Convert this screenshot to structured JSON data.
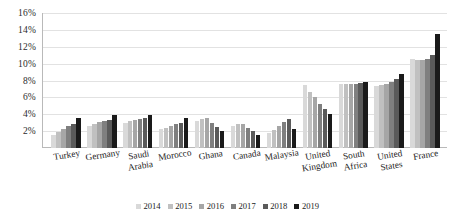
{
  "chart_data": {
    "type": "bar",
    "title": "",
    "xlabel": "",
    "ylabel": "",
    "ylim": [
      0,
      16
    ],
    "y_ticks": [
      "2%",
      "4%",
      "6%",
      "8%",
      "10%",
      "12%",
      "14%",
      "16%"
    ],
    "y_tick_values": [
      2,
      4,
      6,
      8,
      10,
      12,
      14,
      16
    ],
    "grid": true,
    "legend_position": "bottom",
    "categories": [
      "Turkey",
      "Germany",
      "Saudi\nArabia",
      "Morocco",
      "Ghana",
      "Canada",
      "Malaysia",
      "United\nKingdom",
      "South\nAfrica",
      "United\nStates",
      "France"
    ],
    "series": [
      {
        "name": "2014",
        "color": "#d9d9d9",
        "values": [
          1.5,
          2.6,
          3.0,
          2.2,
          3.2,
          2.6,
          1.8,
          7.5,
          7.6,
          7.4,
          10.5
        ]
      },
      {
        "name": "2015",
        "color": "#c0c0c0",
        "values": [
          1.9,
          2.9,
          3.2,
          2.4,
          3.4,
          2.8,
          2.1,
          6.6,
          7.6,
          7.5,
          10.4
        ]
      },
      {
        "name": "2016",
        "color": "#a6a6a6",
        "values": [
          2.2,
          3.1,
          3.3,
          2.6,
          3.5,
          2.9,
          2.6,
          6.0,
          7.6,
          7.6,
          10.4
        ]
      },
      {
        "name": "2017",
        "color": "#7f7f7f",
        "values": [
          2.6,
          3.2,
          3.4,
          2.8,
          3.0,
          2.4,
          3.1,
          5.2,
          7.6,
          7.8,
          10.6
        ]
      },
      {
        "name": "2018",
        "color": "#5a5a5a",
        "values": [
          2.9,
          3.3,
          3.5,
          3.0,
          2.5,
          2.0,
          3.4,
          4.6,
          7.7,
          8.2,
          11.0
        ]
      },
      {
        "name": "2019",
        "color": "#1a1a1a",
        "values": [
          3.5,
          3.9,
          3.9,
          3.6,
          2.0,
          1.6,
          2.3,
          4.0,
          7.8,
          8.8,
          13.5
        ]
      }
    ]
  }
}
